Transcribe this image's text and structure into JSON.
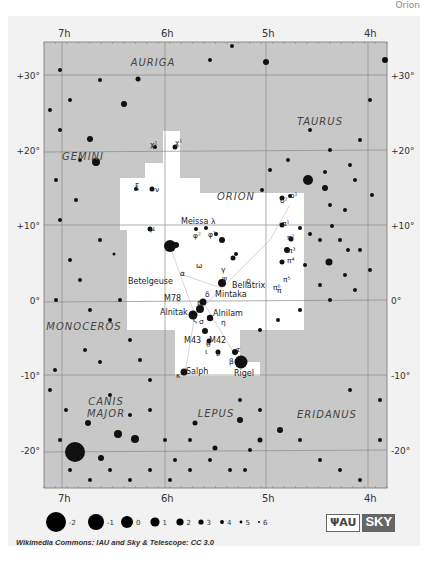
{
  "header": {
    "corner_text": "Orion"
  },
  "map": {
    "title": "Orion constellation chart",
    "ra_labels_top": [
      "7h",
      "6h",
      "5h",
      "4h"
    ],
    "ra_labels_bottom": [
      "7h",
      "6h",
      "5h",
      "4h"
    ],
    "dec_labels_left": [
      "+30°",
      "+20°",
      "+10°",
      "0°",
      "-10°",
      "-20°"
    ],
    "dec_labels_right": [
      "+30°",
      "+20°",
      "+10°",
      "0°",
      "-10°",
      "-20°"
    ],
    "constellations": [
      {
        "name": "AURIGA",
        "x": 153,
        "y": 66
      },
      {
        "name": "TAURUS",
        "x": 320,
        "y": 125
      },
      {
        "name": "GEMINI",
        "x": 83,
        "y": 160
      },
      {
        "name": "ORION",
        "x": 236,
        "y": 200
      },
      {
        "name": "MONOCEROS",
        "x": 84,
        "y": 330
      },
      {
        "name": "CANIS",
        "x": 106,
        "y": 405
      },
      {
        "name": "MAJOR",
        "x": 106,
        "y": 417
      },
      {
        "name": "LEPUS",
        "x": 216,
        "y": 417
      },
      {
        "name": "ERIDANUS",
        "x": 327,
        "y": 418
      }
    ],
    "star_labels": [
      {
        "text": "Betelgeuse",
        "x": 128,
        "y": 284
      },
      {
        "text": "α",
        "x": 180,
        "y": 276
      },
      {
        "text": "Bellatrix",
        "x": 232,
        "y": 288
      },
      {
        "text": "γ",
        "x": 221,
        "y": 272
      },
      {
        "text": "Meissa",
        "x": 181,
        "y": 224
      },
      {
        "text": "λ",
        "x": 211,
        "y": 224
      },
      {
        "text": "φ²",
        "x": 193,
        "y": 238
      },
      {
        "text": "φ¹",
        "x": 208,
        "y": 237
      },
      {
        "text": "μ",
        "x": 150,
        "y": 231
      },
      {
        "text": "χ²",
        "x": 150,
        "y": 147
      },
      {
        "text": "χ¹",
        "x": 175,
        "y": 145
      },
      {
        "text": "ξ",
        "x": 135,
        "y": 189
      },
      {
        "text": "ν",
        "x": 155,
        "y": 192
      },
      {
        "text": "ο¹",
        "x": 290,
        "y": 198
      },
      {
        "text": "ο²",
        "x": 280,
        "y": 203
      },
      {
        "text": "π¹",
        "x": 282,
        "y": 226
      },
      {
        "text": "π²",
        "x": 287,
        "y": 240
      },
      {
        "text": "π³",
        "x": 288,
        "y": 253
      },
      {
        "text": "π⁴",
        "x": 287,
        "y": 263
      },
      {
        "text": "π⁵",
        "x": 283,
        "y": 282
      },
      {
        "text": "π⁶",
        "x": 273,
        "y": 290
      },
      {
        "text": "ω",
        "x": 196,
        "y": 268
      },
      {
        "text": "ψ",
        "x": 222,
        "y": 281
      },
      {
        "text": "ρ",
        "x": 246,
        "y": 283
      },
      {
        "text": "π",
        "x": 277,
        "y": 293
      },
      {
        "text": "M78",
        "x": 164,
        "y": 301
      },
      {
        "text": "δ",
        "x": 205,
        "y": 297
      },
      {
        "text": "Mintaka",
        "x": 215,
        "y": 297
      },
      {
        "text": "ε",
        "x": 197,
        "y": 305
      },
      {
        "text": "Alnitak",
        "x": 160,
        "y": 315
      },
      {
        "text": "Alnilam",
        "x": 213,
        "y": 316
      },
      {
        "text": "ζ",
        "x": 193,
        "y": 322
      },
      {
        "text": "σ",
        "x": 199,
        "y": 324
      },
      {
        "text": "η",
        "x": 221,
        "y": 325
      },
      {
        "text": "M43",
        "x": 184,
        "y": 343
      },
      {
        "text": "M42",
        "x": 209,
        "y": 343
      },
      {
        "text": "θ",
        "x": 206,
        "y": 347
      },
      {
        "text": "ι",
        "x": 205,
        "y": 354
      },
      {
        "text": "υ",
        "x": 216,
        "y": 356
      },
      {
        "text": "τ",
        "x": 236,
        "y": 352
      },
      {
        "text": "β",
        "x": 229,
        "y": 364
      },
      {
        "text": "Rigel",
        "x": 234,
        "y": 376
      },
      {
        "text": "Salph",
        "x": 186,
        "y": 374
      },
      {
        "text": "κ",
        "x": 176,
        "y": 378
      }
    ],
    "background_color": "#c8c8c8",
    "constellation_area_color": "#ffffff",
    "grid_color": "#8a8a8a"
  },
  "legend": {
    "title": "Magnitude scale",
    "magnitudes": [
      {
        "label": "-2",
        "r": 10
      },
      {
        "label": "-1",
        "r": 8
      },
      {
        "label": "0",
        "r": 6
      },
      {
        "label": "1",
        "r": 4.6
      },
      {
        "label": "2",
        "r": 3.6
      },
      {
        "label": "3",
        "r": 2.6
      },
      {
        "label": "4",
        "r": 1.9
      },
      {
        "label": "5",
        "r": 1.4
      },
      {
        "label": "6",
        "r": 1
      }
    ]
  },
  "footer": {
    "credit": "Wikimedia Commons: IAU and Sky & Telescope: CC 3.0",
    "logo_iau": "ΨAU",
    "logo_sky": "SKY"
  }
}
